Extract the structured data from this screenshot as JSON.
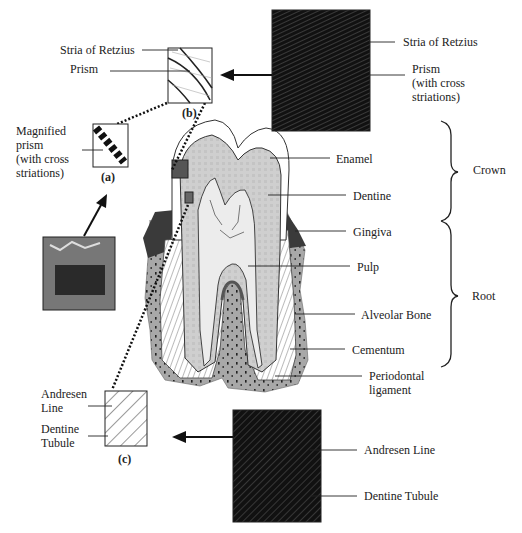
{
  "diagram": {
    "type": "labeled-anatomy",
    "tooth_labels": [
      {
        "id": "enamel",
        "text": "Enamel"
      },
      {
        "id": "dentine",
        "text": "Dentine"
      },
      {
        "id": "gingiva",
        "text": "Gingiva"
      },
      {
        "id": "pulp",
        "text": "Pulp"
      },
      {
        "id": "alveolar_bone",
        "text": "Alveolar Bone"
      },
      {
        "id": "cementum",
        "text": "Cementum"
      },
      {
        "id": "periodontal_1",
        "text": "Periodontal"
      },
      {
        "id": "periodontal_2",
        "text": "ligament"
      }
    ],
    "regions": [
      {
        "id": "crown",
        "text": "Crown"
      },
      {
        "id": "root",
        "text": "Root"
      }
    ],
    "inset_b": {
      "caption": "(b)",
      "schematic_labels": [
        "Stria of Retzius",
        "Prism"
      ],
      "micrograph_labels": [
        "Stria of Retzius",
        "Prism",
        "(with cross",
        "striations)"
      ]
    },
    "inset_a": {
      "caption": "(a)",
      "labels": [
        "Magnified",
        "prism",
        "(with cross",
        "striations)"
      ]
    },
    "inset_c": {
      "caption": "(c)",
      "schematic_labels": [
        "Andresen",
        "Line",
        "Dentine",
        "Tubule"
      ],
      "micrograph_labels": [
        "Andresen Line",
        "Dentine Tubule"
      ]
    }
  }
}
